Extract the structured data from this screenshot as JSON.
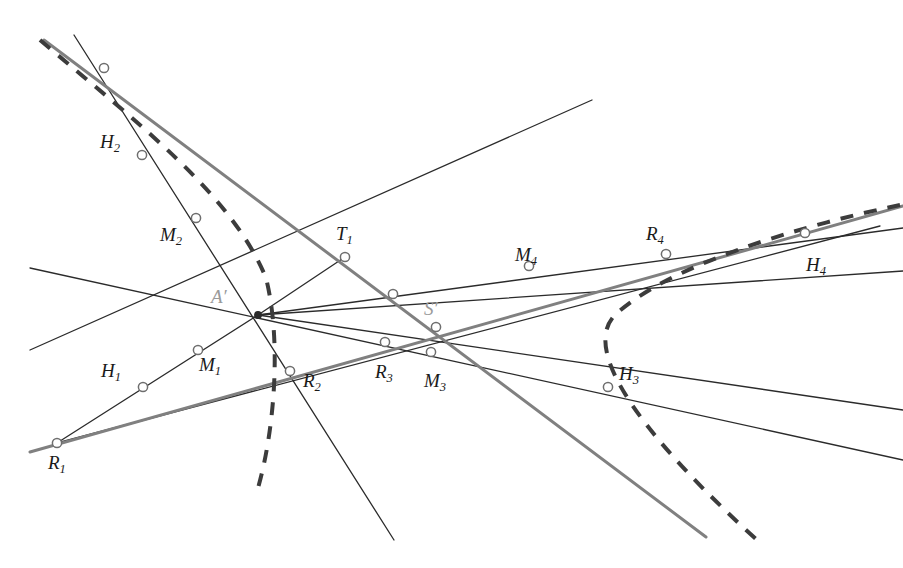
{
  "figure": {
    "width": 903,
    "height": 568,
    "background": "#ffffff",
    "colors": {
      "thin_line": "#2b2b2b",
      "thick_line": "#808080",
      "dashed_conic": "#3c3c3c",
      "marker_fill": "#ffffff",
      "marker_stroke": "#6e6e6e",
      "label_dark": "#1a1a1a",
      "label_faint": "#9a9a9a"
    },
    "labels": [
      {
        "id": "H2",
        "base": "H",
        "sub": "2",
        "prime": "",
        "text": "H2",
        "x": 100,
        "y": 132,
        "faint": false
      },
      {
        "id": "M2",
        "base": "M",
        "sub": "2",
        "prime": "",
        "text": "M2",
        "x": 160,
        "y": 225,
        "faint": false
      },
      {
        "id": "T1",
        "base": "T",
        "sub": "1",
        "prime": "",
        "text": "T1",
        "x": 336,
        "y": 224,
        "faint": false
      },
      {
        "id": "M4",
        "base": "M",
        "sub": "4",
        "prime": "",
        "text": "M4",
        "x": 515,
        "y": 245,
        "faint": false
      },
      {
        "id": "R4",
        "base": "R",
        "sub": "4",
        "prime": "",
        "text": "R4",
        "x": 646,
        "y": 224,
        "faint": false
      },
      {
        "id": "H4",
        "base": "H",
        "sub": "4",
        "prime": "",
        "text": "H4",
        "x": 806,
        "y": 255,
        "faint": false
      },
      {
        "id": "A1",
        "base": "A",
        "sub": "",
        "prime": "′",
        "text": "A′",
        "x": 211,
        "y": 287,
        "faint": true
      },
      {
        "id": "S1",
        "base": "S",
        "sub": "",
        "prime": "′",
        "text": "S′",
        "x": 424,
        "y": 299,
        "faint": true
      },
      {
        "id": "H1",
        "base": "H",
        "sub": "1",
        "prime": "",
        "text": "H1",
        "x": 101,
        "y": 361,
        "faint": false
      },
      {
        "id": "M1",
        "base": "M",
        "sub": "1",
        "prime": "",
        "text": "M1",
        "x": 199,
        "y": 355,
        "faint": false
      },
      {
        "id": "R2",
        "base": "R",
        "sub": "2",
        "prime": "",
        "text": "R2",
        "x": 303,
        "y": 371,
        "faint": false
      },
      {
        "id": "R3",
        "base": "R",
        "sub": "3",
        "prime": "",
        "text": "R3",
        "x": 375,
        "y": 362,
        "faint": false
      },
      {
        "id": "M3",
        "base": "M",
        "sub": "3",
        "prime": "",
        "text": "M3",
        "x": 424,
        "y": 371,
        "faint": false
      },
      {
        "id": "H3",
        "base": "H",
        "sub": "3",
        "prime": "",
        "text": "H3",
        "x": 619,
        "y": 364,
        "faint": false
      },
      {
        "id": "R1",
        "base": "R",
        "sub": "1",
        "prime": "",
        "text": "R1",
        "x": 48,
        "y": 453,
        "faint": false
      }
    ],
    "markers": [
      {
        "id": "marker-top-left",
        "x": 104,
        "y": 68,
        "r": 4.6
      },
      {
        "id": "marker-H2",
        "x": 142,
        "y": 155,
        "r": 4.6
      },
      {
        "id": "marker-M2",
        "x": 196,
        "y": 218,
        "r": 4.6
      },
      {
        "id": "marker-T1",
        "x": 345,
        "y": 257,
        "r": 4.6
      },
      {
        "id": "marker-unlabeled",
        "x": 393,
        "y": 294,
        "r": 4.6
      },
      {
        "id": "marker-M4",
        "x": 529,
        "y": 266,
        "r": 4.6
      },
      {
        "id": "marker-R4",
        "x": 666,
        "y": 254,
        "r": 4.6
      },
      {
        "id": "marker-H4",
        "x": 805,
        "y": 233,
        "r": 4.6
      },
      {
        "id": "marker-S1",
        "x": 436,
        "y": 327,
        "r": 4.6
      },
      {
        "id": "marker-M1",
        "x": 198,
        "y": 350,
        "r": 4.6
      },
      {
        "id": "marker-R3",
        "x": 385,
        "y": 342,
        "r": 4.6
      },
      {
        "id": "marker-M3",
        "x": 431,
        "y": 352,
        "r": 4.6
      },
      {
        "id": "marker-R2",
        "x": 290,
        "y": 371,
        "r": 4.6
      },
      {
        "id": "marker-H1",
        "x": 143,
        "y": 387,
        "r": 4.6
      },
      {
        "id": "marker-H3",
        "x": 608,
        "y": 387,
        "r": 4.6
      },
      {
        "id": "marker-R1",
        "x": 57,
        "y": 443,
        "r": 4.6
      },
      {
        "id": "marker-Aprime",
        "x": 258,
        "y": 315,
        "r": 3.2
      }
    ],
    "thin_lines": [
      {
        "id": "line-pencil-upper-left",
        "x1": 74,
        "y1": 35,
        "x2": 394,
        "y2": 540
      },
      {
        "id": "line-pencil-to-topright",
        "x1": 30,
        "y1": 350,
        "x2": 592,
        "y2": 100
      },
      {
        "id": "line-pencil-left-upper",
        "x1": 30,
        "y1": 268,
        "x2": 903,
        "y2": 460
      },
      {
        "id": "line-pencil-to-H4",
        "x1": 57,
        "y1": 443,
        "x2": 880,
        "y2": 226
      },
      {
        "id": "line-R4-to-H3",
        "x1": 258,
        "y1": 315,
        "x2": 903,
        "y2": 410
      },
      {
        "id": "line-Aprime-to-R4",
        "x1": 258,
        "y1": 315,
        "x2": 903,
        "y2": 228
      },
      {
        "id": "line-Aprime-to-M4",
        "x1": 258,
        "y1": 315,
        "x2": 903,
        "y2": 271
      }
    ],
    "thick_lines": [
      {
        "id": "thickline-T1-axis",
        "x1": 44,
        "y1": 40,
        "x2": 706,
        "y2": 537
      },
      {
        "id": "thickline-R1-to-H4",
        "x1": 30,
        "y1": 452,
        "x2": 903,
        "y2": 206
      }
    ],
    "conic": {
      "id": "dashed-hyperbola",
      "style": "dashed",
      "dash_pattern": "13 11",
      "stroke_width": 4,
      "left_branch": {
        "from": [
          40,
          40
        ],
        "vertex": [
          268,
          281
        ],
        "to": [
          258,
          488
        ]
      },
      "right_branch": {
        "from": [
          900,
          205
        ],
        "vertex": [
          604,
          327
        ],
        "to": [
          757,
          540
        ]
      }
    }
  }
}
